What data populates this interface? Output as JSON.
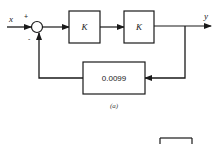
{
  "diagram": {
    "type": "block-diagram",
    "caption": "(a)",
    "input_label": "x",
    "output_label": "y",
    "summing_junction": {
      "plus_sign": "+",
      "minus_sign": "-"
    },
    "forward_blocks": [
      {
        "label": "K"
      },
      {
        "label": "K"
      }
    ],
    "feedback_block": {
      "label": "0.0099"
    },
    "colors": {
      "line": "#1a1a1a",
      "background": "#ffffff"
    }
  }
}
